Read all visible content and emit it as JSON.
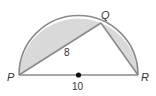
{
  "figure": {
    "points": {
      "P": {
        "label": "P",
        "x": 19,
        "y": 75
      },
      "Q": {
        "label": "Q",
        "x": 101,
        "y": 23
      },
      "R": {
        "label": "R",
        "x": 138,
        "y": 75
      },
      "center": {
        "x": 78.5,
        "y": 75
      }
    },
    "radius": 59.5,
    "segment_labels": {
      "PQ": "8",
      "PR": "10"
    },
    "colors": {
      "stroke": "#8a8a8a",
      "shade": "#d9d9d9",
      "center_dot": "#111111",
      "text": "#333333"
    }
  }
}
